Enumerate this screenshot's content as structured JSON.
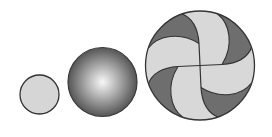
{
  "diagram": {
    "background": "#ffffff",
    "stroke_color": "#333333",
    "shapes": [
      {
        "id": "flat-disc",
        "type": "circle",
        "cx": 39.5,
        "cy": 94.5,
        "r": 19.5,
        "fill": "#d6d6d6"
      },
      {
        "id": "shaded-sphere",
        "type": "sphere",
        "cx": 102.5,
        "cy": 82,
        "r": 34.5,
        "highlight": "#f8f8f8",
        "mid": "#b0b0b0",
        "edge": "#555555"
      },
      {
        "id": "pinwheel-disc",
        "type": "pinwheel",
        "cx": 200,
        "cy": 65.5,
        "r": 54.5,
        "blade_fill": "#d8d8d8",
        "crescent_fill": "#6e6e6e",
        "arm_count": 4,
        "rotations": [
          0,
          90,
          180,
          270
        ]
      }
    ]
  }
}
